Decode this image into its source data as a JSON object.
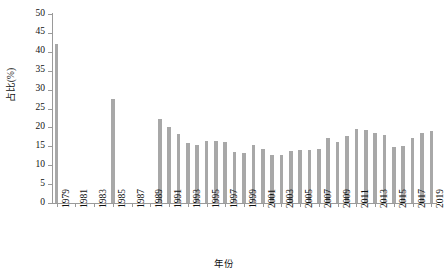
{
  "chart_data": {
    "type": "bar",
    "title": "",
    "xlabel": "年份",
    "ylabel": "占比(%)",
    "ylim": [
      0,
      50
    ],
    "ytick_step": 5,
    "yticks": [
      0,
      5,
      10,
      15,
      20,
      25,
      30,
      35,
      40,
      45,
      50
    ],
    "xlim": [
      1979,
      2019
    ],
    "xtick_labels": [
      "1979",
      "1981",
      "1983",
      "1985",
      "1987",
      "1989",
      "1991",
      "1993",
      "1995",
      "1997",
      "1999",
      "2001",
      "2003",
      "2005",
      "2007",
      "2009",
      "2011",
      "2013",
      "2015",
      "2017",
      "2019"
    ],
    "xtick_step": 2,
    "grid": false,
    "legend": false,
    "bar_color": "#a8a8a8",
    "categories": [
      "1979",
      "1980",
      "1981",
      "1982",
      "1983",
      "1984",
      "1985",
      "1986",
      "1987",
      "1988",
      "1989",
      "1990",
      "1991",
      "1992",
      "1993",
      "1994",
      "1995",
      "1996",
      "1997",
      "1998",
      "1999",
      "2000",
      "2001",
      "2002",
      "2003",
      "2004",
      "2005",
      "2006",
      "2007",
      "2008",
      "2009",
      "2010",
      "2011",
      "2012",
      "2013",
      "2014",
      "2015",
      "2016",
      "2017",
      "2018",
      "2019"
    ],
    "values": [
      42.0,
      null,
      null,
      null,
      null,
      null,
      27.5,
      null,
      null,
      null,
      null,
      22.3,
      20.0,
      18.3,
      15.8,
      15.3,
      16.3,
      16.4,
      16.2,
      13.6,
      13.1,
      15.3,
      14.3,
      12.7,
      12.8,
      13.8,
      13.9,
      13.9,
      14.2,
      17.3,
      16.1,
      17.6,
      19.6,
      19.3,
      18.6,
      17.9,
      14.9,
      15.2,
      17.2,
      18.4,
      19.1
    ]
  }
}
